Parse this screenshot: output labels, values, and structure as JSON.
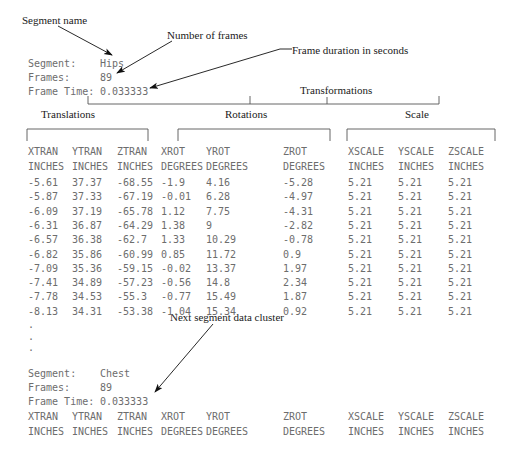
{
  "figure": {
    "text_color": "#6d6d6d",
    "annotation_color": "#1a1a1a",
    "rule_color": "#555555"
  },
  "annotations": [
    {
      "name": "segment-name",
      "label": "Segment name"
    },
    {
      "name": "number-of-frames",
      "label": "Number of frames"
    },
    {
      "name": "frame-duration",
      "label": "Frame duration in seconds"
    },
    {
      "name": "transformations",
      "label": "Transformations"
    },
    {
      "name": "next-segment-cluster",
      "label": "Next segment data cluster"
    }
  ],
  "group_labels": [
    {
      "name": "translations",
      "label": "Translations"
    },
    {
      "name": "rotations",
      "label": "Rotations"
    },
    {
      "name": "scale",
      "label": "Scale"
    }
  ],
  "segment_1": {
    "segment_label": "Segment:",
    "segment_value": "Hips",
    "frames_label": "Frames:",
    "frames_value": "89",
    "frame_time_label": "Frame Time:",
    "frame_time_value": "0.033333"
  },
  "segment_2": {
    "segment_label": "Segment:",
    "segment_value": "Chest",
    "frames_label": "Frames:",
    "frames_value": "89",
    "frame_time_label": "Frame Time:",
    "frame_time_value": "0.033333"
  },
  "table": {
    "headers_line1": [
      "XTRAN",
      "YTRAN",
      "ZTRAN",
      "XROT",
      "YROT",
      "ZROT",
      "XSCALE",
      "YSCALE",
      "ZSCALE"
    ],
    "headers_line2": [
      "INCHES",
      "INCHES",
      "INCHES",
      "DEGREES",
      "DEGREES",
      "DEGREES",
      "INCHES",
      "INCHES",
      "INCHES"
    ],
    "rows": [
      [
        "-5.61",
        "37.37",
        "-68.55",
        "-1.9",
        "4.16",
        "-5.28",
        "5.21",
        "5.21",
        "5.21"
      ],
      [
        "-5.87",
        "37.33",
        "-67.19",
        "-0.01",
        "6.28",
        "-4.97",
        "5.21",
        "5.21",
        "5.21"
      ],
      [
        "-6.09",
        "37.19",
        "-65.78",
        "1.12",
        "7.75",
        "-4.31",
        "5.21",
        "5.21",
        "5.21"
      ],
      [
        "-6.31",
        "36.87",
        "-64.29",
        "1.38",
        "9",
        "-2.82",
        "5.21",
        "5.21",
        "5.21"
      ],
      [
        "-6.57",
        "36.38",
        "-62.7",
        "1.33",
        "10.29",
        "-0.78",
        "5.21",
        "5.21",
        "5.21"
      ],
      [
        "-6.82",
        "35.86",
        "-60.99",
        "0.85",
        "11.72",
        "0.9",
        "5.21",
        "5.21",
        "5.21"
      ],
      [
        "-7.09",
        "35.36",
        "-59.15",
        "-0.02",
        "13.37",
        "1.97",
        "5.21",
        "5.21",
        "5.21"
      ],
      [
        "-7.41",
        "34.89",
        "-57.23",
        "-0.56",
        "14.8",
        "2.34",
        "5.21",
        "5.21",
        "5.21"
      ],
      [
        "-7.78",
        "34.53",
        "-55.3",
        "-0.77",
        "15.49",
        "1.87",
        "5.21",
        "5.21",
        "5.21"
      ],
      [
        "-8.13",
        "34.31",
        "-53.38",
        "-1.04",
        "15.34",
        "0.92",
        "5.21",
        "5.21",
        "5.21"
      ]
    ],
    "ellipsis": [
      ".",
      ".",
      "."
    ],
    "column_x": [
      28,
      72,
      117,
      161,
      206,
      283,
      348,
      398,
      448
    ]
  }
}
